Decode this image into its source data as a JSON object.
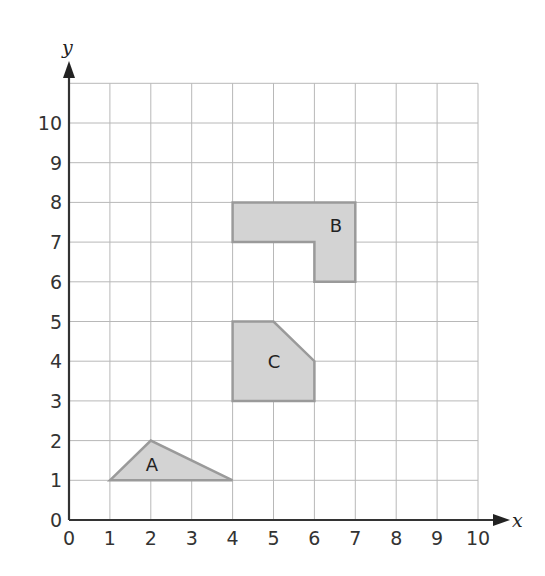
{
  "chart_data": {
    "type": "scatter",
    "title": "",
    "xlabel": "x",
    "ylabel": "y",
    "xlim": [
      0,
      10
    ],
    "ylim": [
      0,
      11
    ],
    "grid": true,
    "x_ticks": [
      "0",
      "1",
      "2",
      "3",
      "4",
      "5",
      "6",
      "7",
      "8",
      "9",
      "10"
    ],
    "y_ticks": [
      "0",
      "1",
      "2",
      "3",
      "4",
      "5",
      "6",
      "7",
      "8",
      "9",
      "10"
    ],
    "shapes": [
      {
        "label": "A",
        "fill": "#d3d3d3",
        "stroke": "#9a9a9a",
        "vertices": [
          [
            1,
            1
          ],
          [
            2,
            2
          ],
          [
            4,
            1
          ]
        ],
        "label_pos": [
          2,
          1.4
        ]
      },
      {
        "label": "B",
        "fill": "#d3d3d3",
        "stroke": "#9a9a9a",
        "vertices": [
          [
            4,
            8
          ],
          [
            7,
            8
          ],
          [
            7,
            6
          ],
          [
            6,
            6
          ],
          [
            6,
            7
          ],
          [
            4,
            7
          ]
        ],
        "label_pos": [
          6.5,
          7.4
        ]
      },
      {
        "label": "C",
        "fill": "#d3d3d3",
        "stroke": "#9a9a9a",
        "vertices": [
          [
            4,
            5
          ],
          [
            5,
            5
          ],
          [
            6,
            4
          ],
          [
            6,
            3
          ],
          [
            4,
            3
          ]
        ],
        "label_pos": [
          5,
          3.95
        ]
      }
    ]
  },
  "labels": {
    "x_axis": "x",
    "y_axis": "y",
    "shape_a": "A",
    "shape_b": "B",
    "shape_c": "C"
  }
}
